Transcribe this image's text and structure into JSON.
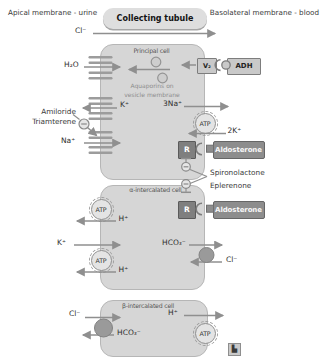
{
  "colors": {
    "cell_fill": "#d6d6d6",
    "cell_border": "#b6b6b6",
    "arrow": "#8f8f8f",
    "dark_box_fill": "#8d8d8d",
    "dark_box_border": "#666666",
    "receptor_fill": "#7f7f7f",
    "text": "#2e2e2e",
    "muted_text": "#8d8d8d"
  },
  "header": {
    "apical_label": "Apical membrane - urine",
    "tubule_title": "Collecting tubule",
    "basolateral_label": "Basolateral membrane - blood"
  },
  "lumen": {
    "cl_label": "Cl⁻"
  },
  "principal_cell": {
    "name": "Principal cell",
    "h2o_label": "H₂O",
    "aquaporin_note_line1": "Aquaporins on",
    "aquaporin_note_line2": "vesicle membrane",
    "v2_receptor_label": "V₂",
    "adh_label": "ADH",
    "k_label": "K⁺",
    "na3_label": "3Na⁺",
    "atp_label": "ATP",
    "k2_label": "2K⁺",
    "na_label": "Na⁺",
    "receptor_label": "R",
    "aldosterone_label": "Aldosterone"
  },
  "drugs": {
    "amiloride": "Amiloride",
    "triamterene": "Triamterene",
    "spironolactone": "Spironolactone",
    "eplerenone": "Eplerenone"
  },
  "alpha_intercalated_cell": {
    "name": "α-intercalated cell",
    "atp_label": "ATP",
    "h_top_label": "H⁺",
    "k_label": "K⁺",
    "h_bottom_label": "H⁺",
    "hco3_label": "HCO₃⁻",
    "cl_label": "Cl⁻",
    "receptor_label": "R",
    "aldosterone_label": "Aldosterone"
  },
  "beta_intercalated_cell": {
    "name": "β-intercalated cell",
    "cl_label": "Cl⁻",
    "hco3_label": "HCO₃⁻",
    "h_label": "H⁺",
    "atp_label": "ATP"
  },
  "footer": {
    "logo_glyph": "▙"
  }
}
